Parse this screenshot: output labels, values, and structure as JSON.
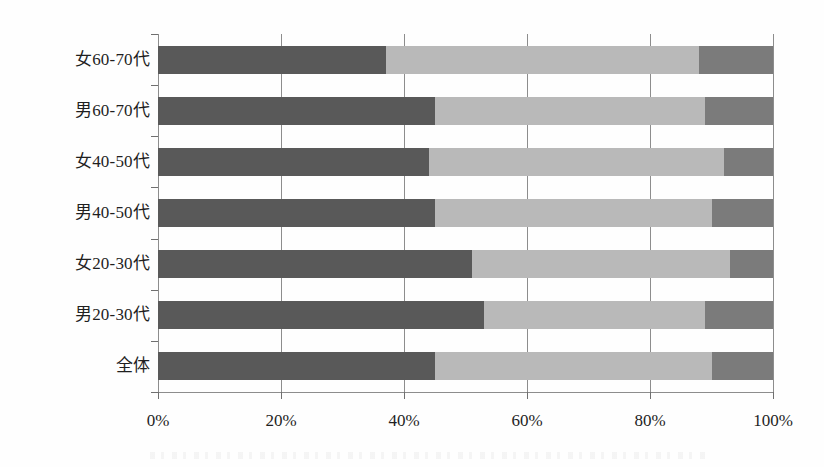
{
  "chart_data": {
    "type": "bar",
    "orientation": "horizontal",
    "stacked": true,
    "stacked_mode": "percent",
    "title": "",
    "subtitle": "",
    "xlabel": "",
    "ylabel": "",
    "xlim": [
      0,
      100
    ],
    "grid": true,
    "legend": false,
    "legend_position": "none",
    "x_tick_labels": [
      "0%",
      "20%",
      "40%",
      "60%",
      "80%",
      "100%"
    ],
    "x_tick_values": [
      0,
      20,
      40,
      60,
      80,
      100
    ],
    "categories": [
      "女60-70代",
      "男60-70代",
      "女40-50代",
      "男40-50代",
      "女20-30代",
      "男20-30代",
      "全体"
    ],
    "series": [
      {
        "name": "segment-1",
        "color": "#595959",
        "values": [
          37,
          45,
          44,
          45,
          51,
          53,
          45
        ]
      },
      {
        "name": "segment-2",
        "color": "#b9b9b9",
        "values": [
          51,
          44,
          48,
          45,
          42,
          36,
          45
        ]
      },
      {
        "name": "segment-3",
        "color": "#7b7b7b",
        "values": [
          12,
          11,
          8,
          10,
          7,
          11,
          10
        ]
      }
    ]
  },
  "colors": {
    "segment_1": "#595959",
    "segment_2": "#b9b9b9",
    "segment_3": "#7b7b7b",
    "axis": "#8d8d8d",
    "text": "#1f1f1f",
    "background": "#ffffff"
  }
}
